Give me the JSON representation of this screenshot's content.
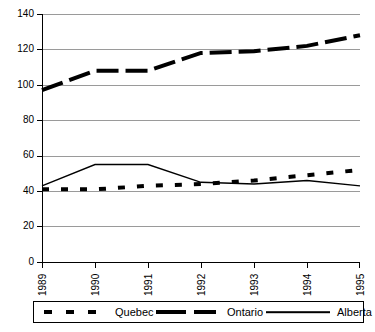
{
  "chart_data": {
    "type": "line",
    "title": "",
    "subtitle": "",
    "xlabel": "",
    "ylabel": "",
    "x": [
      "1989",
      "1990",
      "1991",
      "1992",
      "1993",
      "1994",
      "1995"
    ],
    "categories": [
      "1989",
      "1990",
      "1991",
      "1992",
      "1993",
      "1994",
      "1995"
    ],
    "xlim": [
      1989,
      1995
    ],
    "ylim": [
      0,
      140
    ],
    "y_ticks": [
      0,
      20,
      40,
      60,
      80,
      100,
      120,
      140
    ],
    "x_ticks": [
      "1989",
      "1990",
      "1991",
      "1992",
      "1993",
      "1994",
      "1995"
    ],
    "grid": "horizontal",
    "legend_position": "bottom",
    "series": [
      {
        "name": "Quebec",
        "style": "thick-dotted",
        "color": "#000000",
        "values": [
          41,
          41,
          43,
          44,
          46,
          49,
          52
        ]
      },
      {
        "name": "Ontario",
        "style": "thick-dashed",
        "color": "#000000",
        "values": [
          97,
          108,
          108,
          118,
          119,
          122,
          128
        ]
      },
      {
        "name": "Alberta",
        "style": "thin-solid",
        "color": "#000000",
        "values": [
          43,
          55,
          55,
          45,
          44,
          46,
          43
        ]
      }
    ]
  },
  "axis": {
    "y_tick_labels": [
      "140",
      "120",
      "100",
      "80",
      "60",
      "40",
      "20",
      "0"
    ],
    "x_tick_labels": [
      "1989",
      "1990",
      "1991",
      "1992",
      "1993",
      "1994",
      "1995"
    ]
  },
  "legend": {
    "entries": [
      {
        "label": "Quebec",
        "style": "thick-dotted"
      },
      {
        "label": "Ontario",
        "style": "thick-dashed"
      },
      {
        "label": "Alberta",
        "style": "thin-solid"
      }
    ]
  }
}
